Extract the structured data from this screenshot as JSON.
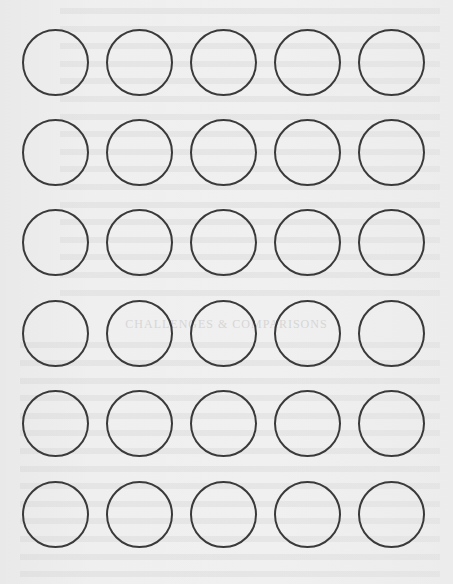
{
  "page": {
    "type": "printable-label-sheet",
    "background": "#eeeeee",
    "circle_stroke": "#3a3a3a",
    "grid": {
      "columns": 5,
      "rows": 6,
      "total": 30
    }
  },
  "bleed_through": {
    "heading": "CHALLENGES & COMPARISONS",
    "heading_y": 325
  },
  "circles": [
    {
      "row": 1,
      "col": 1
    },
    {
      "row": 1,
      "col": 2
    },
    {
      "row": 1,
      "col": 3
    },
    {
      "row": 1,
      "col": 4
    },
    {
      "row": 1,
      "col": 5
    },
    {
      "row": 2,
      "col": 1
    },
    {
      "row": 2,
      "col": 2
    },
    {
      "row": 2,
      "col": 3
    },
    {
      "row": 2,
      "col": 4
    },
    {
      "row": 2,
      "col": 5
    },
    {
      "row": 3,
      "col": 1
    },
    {
      "row": 3,
      "col": 2
    },
    {
      "row": 3,
      "col": 3
    },
    {
      "row": 3,
      "col": 4
    },
    {
      "row": 3,
      "col": 5
    },
    {
      "row": 4,
      "col": 1
    },
    {
      "row": 4,
      "col": 2
    },
    {
      "row": 4,
      "col": 3
    },
    {
      "row": 4,
      "col": 4
    },
    {
      "row": 4,
      "col": 5
    },
    {
      "row": 5,
      "col": 1
    },
    {
      "row": 5,
      "col": 2
    },
    {
      "row": 5,
      "col": 3
    },
    {
      "row": 5,
      "col": 4
    },
    {
      "row": 5,
      "col": 5
    },
    {
      "row": 6,
      "col": 1
    },
    {
      "row": 6,
      "col": 2
    },
    {
      "row": 6,
      "col": 3
    },
    {
      "row": 6,
      "col": 4
    },
    {
      "row": 6,
      "col": 5
    }
  ]
}
